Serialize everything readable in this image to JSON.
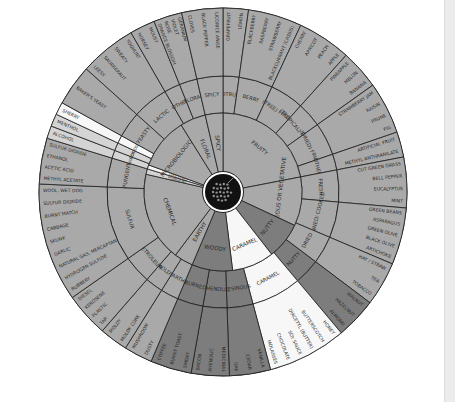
{
  "wheel": {
    "title": "Wine Aroma Wheel",
    "center": {
      "x": 223,
      "y": 192
    },
    "radii": {
      "hub": 19,
      "inner": 79,
      "middle": 116,
      "outer": 184
    },
    "colors": {
      "mid": "#a9a9a9",
      "dark": "#7d7d7d",
      "light": "#d4d4d4",
      "white": "#f7f7f7",
      "hub": "#111111"
    },
    "categories": [
      {
        "label": "FRUITY",
        "start": 270,
        "end": 349,
        "color": "mid",
        "subs": [
          {
            "label": "CITRUS",
            "start": 270,
            "end": 278,
            "items": [
              "GRAPEFRUIT",
              "LEMON"
            ]
          },
          {
            "label": "BERRY",
            "start": 278,
            "end": 295,
            "items": [
              "BLACKBERRY",
              "RASPBERRY",
              "STRAWBERRY",
              "BLACKCURRANT (CASSIS)"
            ]
          },
          {
            "label": "(TREE) FRUIT",
            "start": 295,
            "end": 312,
            "items": [
              "CHERRY",
              "APRICOT",
              "PEACH",
              "APPLE"
            ]
          },
          {
            "label": "(TROPICAL) FRUIT",
            "start": 312,
            "end": 324.5,
            "items": [
              "PINEAPPLE",
              "MELON",
              "BANANA"
            ]
          },
          {
            "label": "(DRIED) FRUIT",
            "start": 324.5,
            "end": 341,
            "items": [
              "STRAWBERRY JAM",
              "RAISIN",
              "PRUNE",
              "FIG"
            ]
          },
          {
            "label": "OTHER",
            "start": 341,
            "end": 349,
            "items": [
              "ARTIFICIAL FRUIT",
              "METHYL ANTHRANILATE"
            ]
          }
        ]
      },
      {
        "label": "HERBACEOUS OR VEGETATIVE",
        "start": 349,
        "end": 385,
        "color": "mid",
        "subs": [
          {
            "label": "FRESH",
            "start": 349,
            "end": 365,
            "items": [
              "CUT GREEN GRASS",
              "BELL PEPPER",
              "EUCALYPTUS",
              "MINT"
            ]
          },
          {
            "label": "CANNED/ COOKED",
            "start": 365,
            "end": 383,
            "items": [
              "GREEN BEANS",
              "ASPARAGUS",
              "GREEN OLIVE",
              "BLACK OLIVE",
              "ARTICHOKE"
            ]
          },
          {
            "label": "DRIED",
            "start": 383,
            "end": 397,
            "items": [
              "HAY / STRAW",
              "TEA",
              "TOBACCO"
            ]
          }
        ]
      },
      {
        "label": "NUTTY",
        "start": 385,
        "end": 412,
        "color": "dark",
        "ring2_start": 397,
        "subs": [
          {
            "label": "NUTTY",
            "start": 397,
            "end": 410,
            "items": [
              "WALNUT",
              "HAZELNUT",
              "ALMOND"
            ]
          }
        ]
      },
      {
        "label": "CARAMEL",
        "start": 412,
        "end": 443,
        "color": "white",
        "ring2_start": 410,
        "subs": [
          {
            "label": "CARAMEL",
            "start": 410,
            "end": 435,
            "items": [
              "HONEY",
              "BUTTERSCOTCH",
              "DIACETYL (BUTTER)",
              "SOY SAUCE",
              "CHOCOLATE",
              "MOLASSES"
            ]
          }
        ]
      },
      {
        "label": "WOODY",
        "start": 443,
        "end": 473,
        "color": "dark",
        "subs": [
          {
            "label": "RESINOUS",
            "start": 435,
            "end": 448,
            "items": [
              "VANILLA",
              "CEDAR",
              "OAK"
            ]
          },
          {
            "label": "PHENOLIC",
            "start": 448,
            "end": 460,
            "items": [
              "MEDICINAL",
              "PHENOLIC",
              "BACON"
            ]
          },
          {
            "label": "BURNED",
            "start": 460,
            "end": 473,
            "items": [
              "SMOKY",
              "BURNT TOAST",
              "COFFEE"
            ]
          }
        ]
      },
      {
        "label": "EARTHY",
        "start": 473,
        "end": 487,
        "color": "mid",
        "subs": [
          {
            "label": "EARTHY",
            "start": 473,
            "end": 482,
            "items": [
              "DUSTY",
              "MUSHROOM"
            ]
          },
          {
            "label": "MOLDY",
            "start": 482,
            "end": 491,
            "items": [
              "MOLDY CORK",
              "MOLDY"
            ]
          }
        ]
      },
      {
        "label": "CHEMICAL",
        "start": 487,
        "end": 553,
        "color": "mid",
        "subs": [
          {
            "label": "PETROLEUM",
            "start": 491,
            "end": 505,
            "items": [
              "TAR",
              "PLASTIC",
              "KEROSENE",
              "DIESEL"
            ]
          },
          {
            "label": "SULFUR",
            "start": 505,
            "end": 542.5,
            "items": [
              "RUBBERY",
              "HYDROGEN SULFIDE",
              "NATURAL GAS, MERCAPTAN",
              "GARLIC",
              "SKUNK",
              "CABBAGE",
              "BURNT MATCH",
              "SULFUR DIOXIDE",
              "WOOL, WET DOG"
            ]
          },
          {
            "label": "PUNGENT",
            "start": 542.5,
            "end": 557,
            "items": [
              "METHYL ACETATE",
              "ACETIC ACID",
              "ETHANOL",
              "SULFUR DIOXIDE"
            ]
          }
        ]
      },
      {
        "label": "PUNGENT",
        "start": 553,
        "end": 557,
        "color": "light",
        "subs": [
          {
            "label": "HOT",
            "start": 557,
            "end": 561,
            "items": [
              "ALCOHOL"
            ],
            "color": "light"
          },
          {
            "label": "COOL",
            "start": 561,
            "end": 565,
            "items": [
              "MENTHOL"
            ],
            "color": "light"
          }
        ]
      },
      {
        "label": "OXIDIZED",
        "start": 557,
        "end": 560,
        "color": "white",
        "subs": [
          {
            "label": "OXIDIZED",
            "start": 565,
            "end": 569,
            "items": [
              "SHERRY"
            ],
            "color": "white"
          }
        ]
      },
      {
        "label": "MICROBIOLOGICAL",
        "start": 560,
        "end": 598,
        "color": "mid",
        "subs": [
          {
            "label": "YEASTY",
            "start": 569,
            "end": 582,
            "items": [
              "BAKER'S YEAST"
            ]
          },
          {
            "label": "LACTIC",
            "start": 582,
            "end": 600,
            "items": [
              "LEESY",
              "SAUERKRAUT",
              "SWEATY",
              "YOGHURT"
            ]
          },
          {
            "label": "OTHER",
            "start": 600,
            "end": 608,
            "items": [
              "HORSEY",
              "MOUSY"
            ]
          }
        ]
      },
      {
        "label": "FLORAL",
        "start": 598,
        "end": 617,
        "color": "mid",
        "subs": [
          {
            "label": "FLORAL",
            "start": 608,
            "end": 617,
            "items": [
              "ORANGE BLOSSOM",
              "ROSE",
              "VIOLET",
              "GERANIUM"
            ]
          }
        ]
      },
      {
        "label": "SPICY",
        "start": 617,
        "end": 630,
        "color": "mid",
        "subs": [
          {
            "label": "SPICY",
            "start": 617,
            "end": 630,
            "items": [
              "CLOVES",
              "BLACK PEPPER",
              "LICORICE ANISE"
            ]
          }
        ]
      }
    ]
  }
}
